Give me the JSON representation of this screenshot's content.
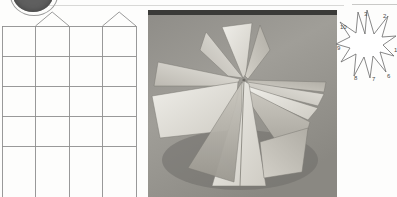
{
  "page": {
    "background_color": "#fdfdfc",
    "scan_rule_color": "#d8d8d6"
  },
  "blob": {
    "name": "cut-off-dark-circle",
    "color": "#5f5f5f",
    "outline_color": "#9a9a9a"
  },
  "net_diagram": {
    "title": "",
    "line_color": "#8e8e8e",
    "columns": 4,
    "rows": 5,
    "column_x": [
      2,
      35.5,
      69,
      102.5,
      136
    ],
    "row_y": [
      16,
      46,
      76,
      106,
      136,
      187
    ],
    "tabs": [
      {
        "label": "tab-column-2",
        "left": 35.5,
        "right": 69,
        "apex_y": 2
      },
      {
        "label": "tab-column-4",
        "left": 102.5,
        "right": 136,
        "apex_y": 2
      }
    ]
  },
  "photo": {
    "caption": "",
    "subject": "folded paper star sculpture",
    "background_color": "#9a9a96",
    "paper_light": "#e3e1db",
    "paper_mid": "#c6c3bb",
    "paper_dark": "#a5a29a",
    "paper_shadow": "#85837c"
  },
  "burst_diagram": {
    "line_color": "#6a6a6a",
    "fill_color": "#ffffff",
    "point_count": 10,
    "labels": [
      {
        "text": "1",
        "x": 58,
        "y": 48
      },
      {
        "text": "2",
        "x": 47,
        "y": 14
      },
      {
        "text": "3",
        "x": 28,
        "y": 12
      },
      {
        "text": "10",
        "x": 4,
        "y": 25
      },
      {
        "text": "9",
        "x": 1,
        "y": 46
      },
      {
        "text": "8",
        "x": 18,
        "y": 76
      },
      {
        "text": "7",
        "x": 36,
        "y": 77
      },
      {
        "text": "6",
        "x": 51,
        "y": 74
      }
    ]
  }
}
